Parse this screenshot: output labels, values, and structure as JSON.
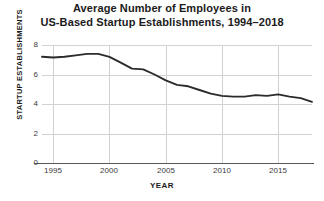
{
  "chart_data": {
    "type": "line",
    "title_line1": "Average Number of Employees in",
    "title_line2": "US-Based Startup Establishments, 1994–2018",
    "xlabel": "YEAR",
    "ylabel": "STARTUP ESTABLISHMENTS",
    "xlim": [
      1994,
      2018
    ],
    "ylim": [
      0,
      8
    ],
    "xticks": [
      1995,
      2000,
      2005,
      2010,
      2015
    ],
    "yticks": [
      0,
      2,
      4,
      6,
      8
    ],
    "grid": "both",
    "legend": "none",
    "line_color": "#2b2b2b",
    "grid_color": "#d2d2d2",
    "x": [
      1994,
      1995,
      1996,
      1997,
      1998,
      1999,
      2000,
      2001,
      2002,
      2003,
      2004,
      2005,
      2006,
      2007,
      2008,
      2009,
      2010,
      2011,
      2012,
      2013,
      2014,
      2015,
      2016,
      2017,
      2018
    ],
    "values": [
      7.2,
      7.15,
      7.2,
      7.3,
      7.4,
      7.4,
      7.2,
      6.8,
      6.4,
      6.35,
      6.0,
      5.6,
      5.3,
      5.2,
      4.95,
      4.7,
      4.55,
      4.5,
      4.5,
      4.6,
      4.55,
      4.65,
      4.5,
      4.4,
      4.15
    ]
  }
}
